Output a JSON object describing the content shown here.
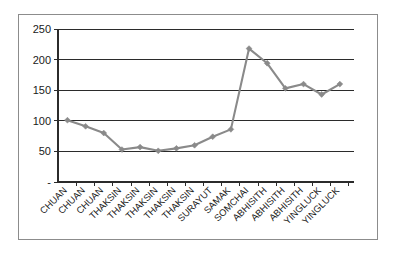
{
  "chart_data": {
    "type": "line",
    "title": "",
    "subtitle": "",
    "xlabel": "",
    "ylabel": "",
    "categories": [
      "CHUAN",
      "CHUAN",
      "CHUAN",
      "THAKSIN",
      "THAKSIN",
      "THAKSIN",
      "THAKSIN",
      "THAKSIN",
      "SURAYUT",
      "SAMAK",
      "SOMCHAI",
      "ABHISITH",
      "ABHISITH",
      "ABHISITH",
      "YINGLUCK",
      "YINGLUCK"
    ],
    "values": [
      101,
      91,
      80,
      53,
      57,
      51,
      55,
      60,
      74,
      86,
      218,
      194,
      153,
      160,
      143,
      160
    ],
    "ylim": [
      0,
      250
    ],
    "ytick_labels": [
      "250",
      "200",
      "150",
      "100",
      "50",
      "-"
    ],
    "ytick_values": [
      250,
      200,
      150,
      100,
      50,
      0
    ],
    "grid": "horizontal",
    "legend": "none",
    "series": [
      {
        "name": "",
        "marker": "diamond",
        "color": "#8a8a8a",
        "values": [
          101,
          91,
          80,
          53,
          57,
          51,
          55,
          60,
          74,
          86,
          218,
          194,
          153,
          160,
          143,
          160
        ]
      }
    ],
    "annotations": []
  },
  "colors": {
    "series": "#8a8a8a",
    "grid": "#2b2b2b",
    "axis": "#2b2b2b",
    "border": "#8c8c8c",
    "text": "#1a1a1a",
    "background": "#ffffff"
  }
}
